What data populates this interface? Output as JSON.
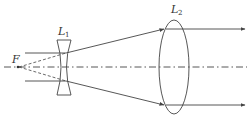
{
  "diagram": {
    "type": "optical-ray-diagram",
    "labels": {
      "focus": "F",
      "lens1_main": "L",
      "lens1_sub": "1",
      "lens2_main": "L",
      "lens2_sub": "2"
    },
    "colors": {
      "line": "#444444",
      "background": "#ffffff"
    }
  }
}
